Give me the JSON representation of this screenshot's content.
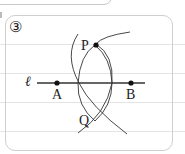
{
  "diagram": {
    "problem_number": "③",
    "line_label": "ℓ",
    "points": [
      {
        "name": "A",
        "label": "A"
      },
      {
        "name": "B",
        "label": "B"
      },
      {
        "name": "P",
        "label": "P"
      },
      {
        "name": "Q",
        "label": "Q"
      }
    ],
    "colors": {
      "stroke": "#333333",
      "panel_border": "#cfcfcf",
      "rule": "#e4e4e4"
    }
  }
}
